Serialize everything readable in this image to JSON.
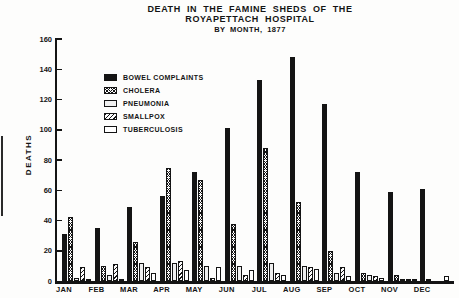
{
  "title": {
    "line1": "DEATH IN THE FAMINE SHEDS OF THE",
    "line2": "ROYAPETTACH HOSPITAL",
    "line3": "BY MONTH, 1877"
  },
  "chart_data": {
    "type": "bar",
    "title": "DEATH IN THE FAMINE SHEDS OF THE ROYAPETTACH HOSPITAL BY MONTH, 1877",
    "xlabel": "",
    "ylabel": "DEATHS",
    "ylim": [
      0,
      160
    ],
    "yticks": [
      0,
      20,
      40,
      60,
      80,
      100,
      120,
      140,
      160
    ],
    "grid": false,
    "legend_position": "upper-left-inside",
    "categories": [
      "JAN",
      "FEB",
      "MAR",
      "APR",
      "MAY",
      "JUN",
      "JUL",
      "AUG",
      "SEP",
      "OCT",
      "NOV",
      "DEC"
    ],
    "series": [
      {
        "name": "BOWEL COMPLAINTS",
        "pattern": "solid",
        "color": "#141414",
        "values": [
          31,
          35,
          49,
          56,
          72,
          101,
          133,
          148,
          117,
          72,
          59,
          61
        ]
      },
      {
        "name": "CHOLERA",
        "pattern": "crosshatch",
        "color": "#141414",
        "values": [
          42,
          10,
          26,
          75,
          67,
          38,
          88,
          52,
          20,
          5,
          4,
          1
        ]
      },
      {
        "name": "PNEUMONIA",
        "pattern": "stipple",
        "color": "#141414",
        "values": [
          2,
          4,
          12,
          12,
          10,
          10,
          12,
          10,
          5,
          4,
          1,
          0
        ]
      },
      {
        "name": "SMALLPOX",
        "pattern": "diagonal",
        "color": "#141414",
        "values": [
          9,
          11,
          9,
          13,
          2,
          4,
          5,
          9,
          9,
          3,
          1,
          0
        ]
      },
      {
        "name": "TUBERCULOSIS",
        "pattern": "empty",
        "color": "#141414",
        "values": [
          1,
          1,
          5,
          7,
          9,
          7,
          4,
          8,
          3,
          2,
          1,
          3
        ]
      }
    ]
  }
}
